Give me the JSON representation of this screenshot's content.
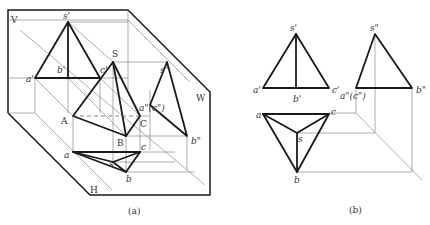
{
  "figure_a": {
    "caption": "(a)",
    "planes": {
      "V": "V",
      "W": "W",
      "H": "H"
    },
    "labels": {
      "s_prime": "s'",
      "a_prime": "a'",
      "b_prime": "b'",
      "c_prime": "c'",
      "S": "S",
      "s_dprime": "s\"",
      "ac_dprime": "a\"(c\")",
      "A": "A",
      "B": "B",
      "C": "C",
      "b_dprime": "b\"",
      "a": "a",
      "b": "b",
      "c": "c",
      "s": "s"
    }
  },
  "figure_b": {
    "caption": "(b)",
    "labels": {
      "s_prime": "s'",
      "a_prime": "a'",
      "b_prime": "b'",
      "c_prime": "c'",
      "s_dprime": "s\"",
      "ac_dprime": "a\"(c\")",
      "b_dprime": "b\"",
      "a": "a",
      "b": "b",
      "c": "c",
      "s": "s"
    }
  }
}
